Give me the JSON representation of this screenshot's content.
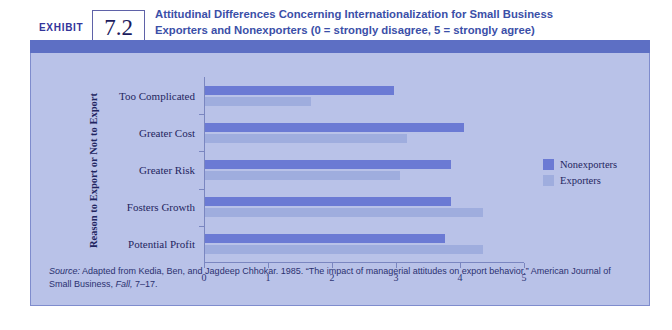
{
  "exhibit": {
    "word": "EXHIBIT",
    "number": "7.2",
    "title_line1": "Attitudinal Differences Concerning Internationalization for Small Business",
    "title_line2": "Exporters and Nonexporters (0 = strongly disagree, 5 = strongly agree)"
  },
  "source": {
    "label": "Source:",
    "text_part1": " Adapted from Kedia, Ben, and Jagdeep Chhokar. 1985. “The impact of managerial attitudes on export behavior.” American Journal of Small Business, ",
    "text_italic": "Fall,",
    "text_part2": " 7–17."
  },
  "colors": {
    "nonexporters": "#6b7ad4",
    "exporters": "#9fadde",
    "panel_background": "#b9c2e8",
    "banner": "#5d6fc4",
    "title_text": "#3b4fa8"
  },
  "chart_data": {
    "type": "bar",
    "orientation": "horizontal",
    "title": "Attitudinal Differences Concerning Internationalization for Small Business Exporters and Nonexporters (0 = strongly disagree, 5 = strongly agree)",
    "xlabel": "",
    "ylabel": "Reason to Export or Not to Export",
    "xlim": [
      0,
      5
    ],
    "xticks": [
      0,
      1,
      2,
      3,
      4,
      5
    ],
    "xtick_labels": [
      "0",
      "1",
      "2",
      "3",
      "4",
      "5"
    ],
    "grid": false,
    "legend_position": "right",
    "categories": [
      "Too Complicated",
      "Greater Cost",
      "Greater Risk",
      "Fosters Growth",
      "Potential Profit"
    ],
    "series": [
      {
        "name": "Nonexporters",
        "color": "#6b7ad4",
        "values": [
          2.95,
          4.05,
          3.85,
          3.85,
          3.75
        ]
      },
      {
        "name": "Exporters",
        "color": "#9fadde",
        "values": [
          1.65,
          3.15,
          3.05,
          4.35,
          4.35
        ]
      }
    ]
  }
}
